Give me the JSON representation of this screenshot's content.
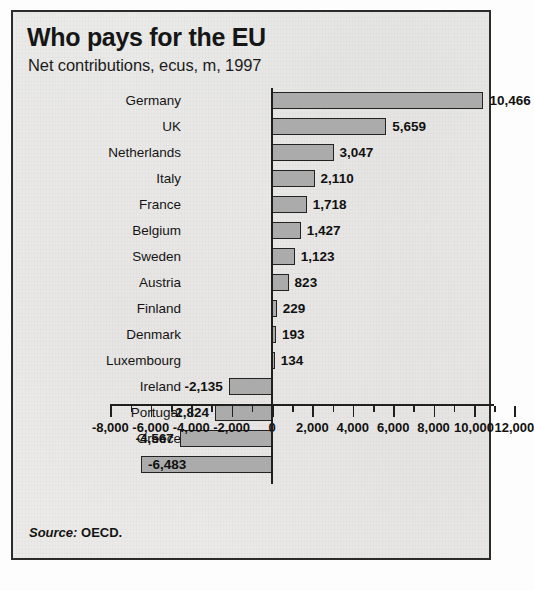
{
  "panel": {
    "title": "Who pays for the EU",
    "subtitle": "Net contributions, ecus, m, 1997",
    "source_label": "Source:",
    "source_value": "OECD."
  },
  "colors": {
    "bar_fill": "#ababab",
    "bar_border": "#232323",
    "panel_border": "#2c2c2c",
    "text": "#141414",
    "background": "#eceae8"
  },
  "chart_data": {
    "type": "bar",
    "orientation": "horizontal",
    "title": "Who pays for the EU",
    "subtitle": "Net contributions, ecus, m, 1997",
    "xlabel": "",
    "ylabel": "",
    "xlim": [
      -8000,
      12000
    ],
    "grid": false,
    "legend": false,
    "units": "ecus, m",
    "year": 1997,
    "source": "OECD",
    "tick_step": 2000,
    "minor_tick_step": 1000,
    "tick_labels": [
      "-8,000",
      "-6,000",
      "-4,000",
      "-2,000",
      "0",
      "2,000",
      "4,000",
      "6,000",
      "8,000",
      "10,000",
      "12,000"
    ],
    "tick_values": [
      -8000,
      -6000,
      -4000,
      -2000,
      0,
      2000,
      4000,
      6000,
      8000,
      10000,
      12000
    ],
    "categories": [
      "Germany",
      "UK",
      "Netherlands",
      "Italy",
      "France",
      "Belgium",
      "Sweden",
      "Austria",
      "Finland",
      "Denmark",
      "Luxembourg",
      "Ireland",
      "Portugal",
      "Greece",
      "Spain"
    ],
    "values": [
      10466,
      5659,
      3047,
      2110,
      1718,
      1427,
      1123,
      823,
      229,
      193,
      134,
      -2135,
      -2824,
      -4567,
      -6483
    ],
    "value_labels": [
      "10,466",
      "5,659",
      "3,047",
      "2,110",
      "1,718",
      "1,427",
      "1,123",
      "823",
      "229",
      "193",
      "134",
      "-2,135",
      "-2,824",
      "-4,567",
      "-6,483"
    ],
    "label_placement": [
      "outside",
      "outside",
      "outside",
      "outside",
      "outside",
      "outside",
      "outside",
      "outside",
      "outside",
      "outside",
      "outside",
      "outside",
      "outside",
      "outside",
      "inside"
    ]
  }
}
